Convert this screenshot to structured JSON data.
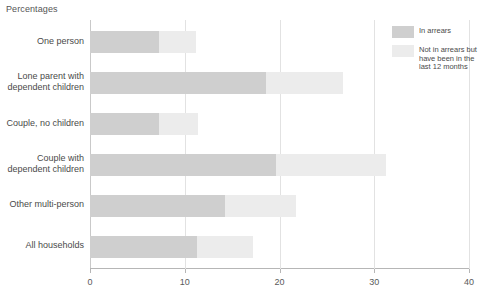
{
  "axis_title": "Percentages",
  "legend": {
    "items": [
      {
        "label": "In arrears",
        "color": "#cfcfcf"
      },
      {
        "label": "Not in arrears but have been in the last 12 months",
        "color": "#ececec"
      }
    ]
  },
  "chart_data": {
    "type": "bar",
    "orientation": "horizontal",
    "stacked": true,
    "title": "",
    "xlabel": "Percentages",
    "ylabel": "",
    "xlim": [
      0,
      40
    ],
    "xticks": [
      0,
      10,
      20,
      30,
      40
    ],
    "xticklabels": [
      "0",
      "10",
      "20",
      "30",
      "40"
    ],
    "grid": "vertical",
    "legend_position": "top-right",
    "categories": [
      "One person",
      "Lone parent with dependent children",
      "Couple, no children",
      "Couple with dependent children",
      "Other multi-person",
      "All households"
    ],
    "series": [
      {
        "name": "In arrears",
        "color": "#cfcfcf",
        "values": [
          7.3,
          18.6,
          7.3,
          19.6,
          14.2,
          11.3
        ]
      },
      {
        "name": "Not in arrears but have been in the last 12 months",
        "color": "#ececec",
        "values": [
          3.9,
          8.1,
          4.1,
          11.6,
          7.5,
          5.9
        ]
      }
    ],
    "totals": [
      11.2,
      26.7,
      11.4,
      31.2,
      21.7,
      17.2
    ]
  }
}
